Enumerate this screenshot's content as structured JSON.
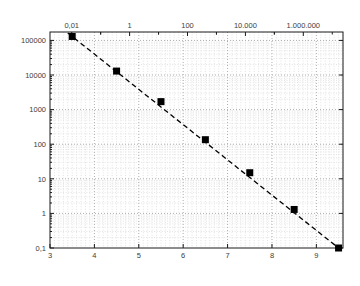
{
  "figure": {
    "top_axis_title": "freigesetzte Energie [TeraJoule]",
    "x_axis_title": "Stärke auf der Richter-Skala",
    "y_axis_title": "mittlere Anzahl pro Jahr"
  },
  "chart_data": {
    "type": "scatter",
    "title": "",
    "xlabel": "Stärke auf der Richter-Skala",
    "ylabel": "mittlere Anzahl pro Jahr",
    "x2label": "freigesetzte Energie [TeraJoule]",
    "x": [
      3.5,
      4.5,
      5.5,
      6.5,
      7.5,
      8.5,
      9.5
    ],
    "y": [
      130000,
      13000,
      1700,
      135,
      15,
      1.3,
      0.1
    ],
    "marker": "filled-black-square",
    "trendline": {
      "style": "dashed",
      "through": [
        [
          3.5,
          130000
        ],
        [
          9.5,
          0.1
        ]
      ],
      "extend_to_x": [
        3.4,
        9.65
      ]
    },
    "xlim": [
      3,
      9.6
    ],
    "ylim": [
      0.1,
      175000
    ],
    "xscale": "linear",
    "yscale": "log",
    "grid": "major-and-minor-dotted",
    "legend": "none",
    "x_ticks": {
      "values": [
        3,
        4,
        5,
        6,
        7,
        8,
        9
      ],
      "labels": [
        "3",
        "4",
        "5",
        "6",
        "7",
        "8",
        "9"
      ]
    },
    "y_ticks": {
      "values": [
        100000,
        10000,
        1000,
        100,
        10,
        1,
        0.1
      ],
      "labels": [
        "100000",
        "10000",
        "1000",
        "100",
        "10",
        "1",
        "0,1"
      ]
    },
    "top_ticks": {
      "labels": [
        "0,01",
        "1",
        "100",
        "10.000",
        "1.000.000"
      ],
      "positions_x": [
        3.489,
        4.793,
        6.097,
        7.402,
        8.706
      ]
    },
    "colors": {
      "background": "#ffffff",
      "axis": "#1a1a1a",
      "text": "#3c3c3c",
      "title_text": "#1c1c1c",
      "marker": "#000000",
      "trend_line": "#000000",
      "grid_major": "#aeaeae",
      "grid_minor": "#e2e2e2"
    }
  }
}
